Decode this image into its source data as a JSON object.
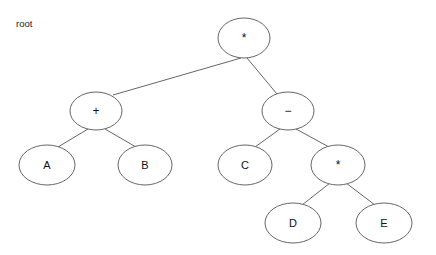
{
  "diagram": {
    "title": "root",
    "caption": {
      "text": "root",
      "x": 16,
      "y": 27
    },
    "colors": {
      "background": "#ffffff",
      "stroke": "#555555",
      "text": "#111111",
      "caption_text": "#222222"
    },
    "canvas": {
      "width": 436,
      "height": 255
    },
    "nodes": [
      {
        "id": "root",
        "label": "*",
        "type": "operator",
        "level": 0,
        "cx": 244,
        "cy": 38,
        "rx": 26,
        "ry": 20
      },
      {
        "id": "plus",
        "label": "+",
        "type": "operator",
        "level": 1,
        "cx": 96,
        "cy": 111,
        "rx": 26,
        "ry": 19
      },
      {
        "id": "minus",
        "label": "−",
        "type": "operator",
        "level": 1,
        "cx": 288,
        "cy": 111,
        "rx": 26,
        "ry": 19
      },
      {
        "id": "a",
        "label": "A",
        "type": "operand",
        "level": 2,
        "cx": 47,
        "cy": 165,
        "rx": 28,
        "ry": 20
      },
      {
        "id": "b",
        "label": "B",
        "type": "operand",
        "level": 2,
        "cx": 145,
        "cy": 165,
        "rx": 27,
        "ry": 20
      },
      {
        "id": "c",
        "label": "C",
        "type": "operand",
        "level": 2,
        "cx": 245,
        "cy": 165,
        "rx": 27,
        "ry": 20
      },
      {
        "id": "mul2",
        "label": "*",
        "type": "operator",
        "level": 2,
        "cx": 338,
        "cy": 165,
        "rx": 27,
        "ry": 20
      },
      {
        "id": "d",
        "label": "D",
        "type": "operand",
        "level": 3,
        "cx": 293,
        "cy": 223,
        "rx": 28,
        "ry": 20
      },
      {
        "id": "e",
        "label": "E",
        "type": "operand",
        "level": 3,
        "cx": 384,
        "cy": 223,
        "rx": 28,
        "ry": 20
      }
    ],
    "edges": [
      {
        "id": "root-plus",
        "from": "root",
        "to": "plus",
        "x1": 241,
        "y1": 58,
        "x2": 113,
        "y2": 95
      },
      {
        "id": "root-minus",
        "from": "root",
        "to": "minus",
        "x1": 247,
        "y1": 58,
        "x2": 277,
        "y2": 94
      },
      {
        "id": "plus-a",
        "from": "plus",
        "to": "a",
        "x1": 88,
        "y1": 129,
        "x2": 58,
        "y2": 147
      },
      {
        "id": "plus-b",
        "from": "plus",
        "to": "b",
        "x1": 105,
        "y1": 129,
        "x2": 136,
        "y2": 147
      },
      {
        "id": "minus-c",
        "from": "minus",
        "to": "c",
        "x1": 280,
        "y1": 129,
        "x2": 255,
        "y2": 147
      },
      {
        "id": "minus-mul2",
        "from": "minus",
        "to": "mul2",
        "x1": 296,
        "y1": 129,
        "x2": 329,
        "y2": 147
      },
      {
        "id": "mul2-d",
        "from": "mul2",
        "to": "d",
        "x1": 330,
        "y1": 183,
        "x2": 302,
        "y2": 205
      },
      {
        "id": "mul2-e",
        "from": "mul2",
        "to": "e",
        "x1": 346,
        "y1": 183,
        "x2": 375,
        "y2": 205
      }
    ]
  }
}
